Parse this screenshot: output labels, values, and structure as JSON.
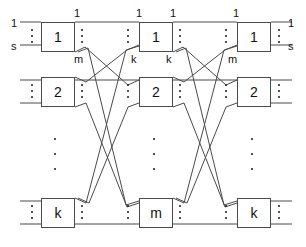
{
  "figure": {
    "stroke_color": "#4a4a4a",
    "text_color": "#111111",
    "background": "#ffffff",
    "width": 306,
    "height": 247
  },
  "stages": [
    {
      "name": "input-stage",
      "modules": [
        {
          "id": "s1r1",
          "label": "1",
          "x": 41,
          "y": 22,
          "w": 34,
          "h": 30
        },
        {
          "id": "s1r2",
          "label": "2",
          "x": 41,
          "y": 77,
          "w": 34,
          "h": 30
        },
        {
          "id": "s1r3",
          "label": "k",
          "x": 41,
          "y": 198,
          "w": 34,
          "h": 30
        }
      ]
    },
    {
      "name": "middle-stage",
      "modules": [
        {
          "id": "s2r1",
          "label": "1",
          "x": 139,
          "y": 22,
          "w": 34,
          "h": 30
        },
        {
          "id": "s2r2",
          "label": "2",
          "x": 139,
          "y": 77,
          "w": 34,
          "h": 30
        },
        {
          "id": "s2r3",
          "label": "m",
          "x": 139,
          "y": 198,
          "w": 34,
          "h": 30
        }
      ]
    },
    {
      "name": "output-stage",
      "modules": [
        {
          "id": "s3r1",
          "label": "1",
          "x": 237,
          "y": 22,
          "w": 34,
          "h": 30
        },
        {
          "id": "s3r2",
          "label": "2",
          "x": 237,
          "y": 77,
          "w": 34,
          "h": 30
        },
        {
          "id": "s3r3",
          "label": "k",
          "x": 237,
          "y": 198,
          "w": 34,
          "h": 30
        }
      ]
    }
  ],
  "port_labels": [
    {
      "id": "in-first",
      "text": "1",
      "x": 11,
      "y": 18
    },
    {
      "id": "in-last",
      "text": "s",
      "x": 11,
      "y": 41
    },
    {
      "id": "s1-out-first",
      "text": "1",
      "x": 74,
      "y": 8
    },
    {
      "id": "s1-out-last",
      "text": "m",
      "x": 74,
      "y": 54
    },
    {
      "id": "s2-in-first",
      "text": "1",
      "x": 136,
      "y": 8
    },
    {
      "id": "s2-in-last",
      "text": "k",
      "x": 131,
      "y": 54
    },
    {
      "id": "s2-out-first",
      "text": "1",
      "x": 170,
      "y": 8
    },
    {
      "id": "s2-out-last",
      "text": "k",
      "x": 166,
      "y": 54
    },
    {
      "id": "s3-in-first",
      "text": "1",
      "x": 233,
      "y": 8
    },
    {
      "id": "s3-in-last",
      "text": "m",
      "x": 228,
      "y": 54
    },
    {
      "id": "out-first",
      "text": "1",
      "x": 288,
      "y": 18
    },
    {
      "id": "out-last",
      "text": "s",
      "x": 288,
      "y": 41
    }
  ],
  "port_dots": [
    {
      "id": "left-in-dots",
      "x": 30,
      "y": 29,
      "h": 14
    },
    {
      "id": "s1r1-out-dots",
      "x": 80,
      "y": 29,
      "h": 14
    },
    {
      "id": "s2r1-in-dots",
      "x": 126,
      "y": 29,
      "h": 14
    },
    {
      "id": "s2r1-out-dots",
      "x": 178,
      "y": 29,
      "h": 14
    },
    {
      "id": "s3r1-in-dots",
      "x": 224,
      "y": 29,
      "h": 14
    },
    {
      "id": "s3r1-out-dots",
      "x": 277,
      "y": 29,
      "h": 14
    },
    {
      "id": "s1r2-in-dots",
      "x": 30,
      "y": 84,
      "h": 14
    },
    {
      "id": "s1r2-out-dots",
      "x": 80,
      "y": 84,
      "h": 14
    },
    {
      "id": "s2r2-in-dots",
      "x": 126,
      "y": 84,
      "h": 14
    },
    {
      "id": "s2r2-out-dots",
      "x": 178,
      "y": 84,
      "h": 14
    },
    {
      "id": "s3r2-in-dots",
      "x": 224,
      "y": 84,
      "h": 14
    },
    {
      "id": "s3r2-out-dots",
      "x": 277,
      "y": 84,
      "h": 14
    },
    {
      "id": "s1r3-in-dots",
      "x": 30,
      "y": 205,
      "h": 14
    },
    {
      "id": "s1r3-out-dots",
      "x": 80,
      "y": 205,
      "h": 14
    },
    {
      "id": "s2r3-in-dots",
      "x": 126,
      "y": 205,
      "h": 14
    },
    {
      "id": "s2r3-out-dots",
      "x": 178,
      "y": 205,
      "h": 14
    },
    {
      "id": "s3r3-in-dots",
      "x": 224,
      "y": 205,
      "h": 14
    },
    {
      "id": "s3r3-out-dots",
      "x": 277,
      "y": 205,
      "h": 14
    }
  ],
  "ellipsis_columns": [
    {
      "id": "col1-vertical-ellipsis",
      "x": 53,
      "y": 138,
      "h": 32
    },
    {
      "id": "col2-vertical-ellipsis",
      "x": 152,
      "y": 138,
      "h": 32
    },
    {
      "id": "col3-vertical-ellipsis",
      "x": 250,
      "y": 138,
      "h": 32
    }
  ],
  "wires": {
    "note": "polyline point lists in figure pixel coordinates",
    "edge_stubs": [
      {
        "id": "in-1-r1",
        "points": "20,22 41,22"
      },
      {
        "id": "in-s-r1",
        "points": "20,45 41,45"
      },
      {
        "id": "in-1-r2",
        "points": "20,80 41,80"
      },
      {
        "id": "in-s-r2",
        "points": "20,103 41,103"
      },
      {
        "id": "in-1-r3",
        "points": "20,201 41,201"
      },
      {
        "id": "in-s-r3",
        "points": "20,224 41,224"
      },
      {
        "id": "out-1-r1",
        "points": "271,22 292,22"
      },
      {
        "id": "out-s-r1",
        "points": "271,45 292,45"
      },
      {
        "id": "out-1-r2",
        "points": "271,80 292,80"
      },
      {
        "id": "out-s-r2",
        "points": "271,103 292,103"
      },
      {
        "id": "out-1-r3",
        "points": "271,201 292,201"
      },
      {
        "id": "out-s-r3",
        "points": "271,224 292,224"
      }
    ],
    "stage1_to_stage2": [
      {
        "id": "w-s1r1-p1-s2r1",
        "points": "75,22 139,22"
      },
      {
        "id": "w-s1r1-pm-s2r2",
        "points": "75,52 85,47 128,85 139,80"
      },
      {
        "id": "w-s1r1-px-s2r3",
        "points": "78,52 88,48 126,205 139,201"
      },
      {
        "id": "w-s1r2-p1-s2r1",
        "points": "75,77 86,82 127,50 139,45"
      },
      {
        "id": "w-s1r2-pm-s2r2",
        "points": "75,80 139,80"
      },
      {
        "id": "w-s1r2-px-s2r3",
        "points": "75,107 86,103 127,207 139,203"
      },
      {
        "id": "w-s1r3-p1-s2r1",
        "points": "75,198 86,203 126,50 139,46"
      },
      {
        "id": "w-s1r3-p2-s2r2",
        "points": "78,198 89,203 128,107 139,103"
      },
      {
        "id": "w-s1r3-pm-s2r3",
        "points": "75,224 139,224"
      }
    ],
    "stage2_to_stage3": [
      {
        "id": "w-s2r1-p1-s3r1",
        "points": "173,22 237,22"
      },
      {
        "id": "w-s2r1-pk-s3r2",
        "points": "173,52 183,47 226,85 237,80"
      },
      {
        "id": "w-s2r1-px-s3r3",
        "points": "176,52 186,48 224,205 237,201"
      },
      {
        "id": "w-s2r2-p1-s3r1",
        "points": "173,77 184,82 225,50 237,45"
      },
      {
        "id": "w-s2r2-pk-s3r2",
        "points": "173,80 237,80"
      },
      {
        "id": "w-s2r2-px-s3r3",
        "points": "173,107 184,103 225,207 237,203"
      },
      {
        "id": "w-s2r3-p1-s3r1",
        "points": "173,198 184,203 224,50 237,46"
      },
      {
        "id": "w-s2r3-p2-s3r2",
        "points": "176,198 187,203 226,107 237,103"
      },
      {
        "id": "w-s2r3-pk-s3r3",
        "points": "173,224 237,224"
      }
    ]
  }
}
